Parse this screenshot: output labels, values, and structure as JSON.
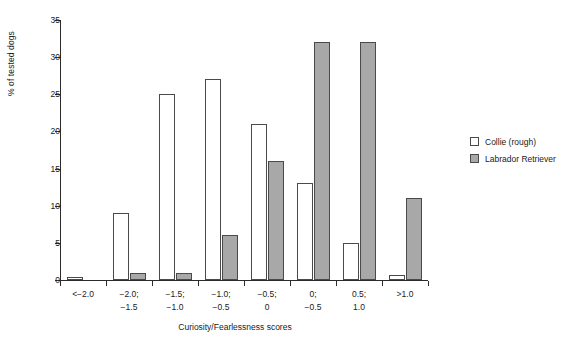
{
  "chart_data": {
    "type": "bar",
    "title": "",
    "xlabel": "Curiosity/Fearlessness scores",
    "ylabel": "% of tested dogs",
    "ylim": [
      0,
      35
    ],
    "yticks": [
      0,
      5,
      10,
      15,
      20,
      25,
      30,
      35
    ],
    "ytick_labels": [
      "0",
      "5",
      "10",
      "15",
      "20",
      "25",
      "30",
      "35"
    ],
    "grid": false,
    "legend_position": "right",
    "categories": [
      "<-2.0",
      "-2.0; -1.5",
      "-1.5; -1.0",
      "-1.0; -0.5",
      "-0.5; 0",
      "0; -0.5",
      "0.5; 1.0",
      ">1.0"
    ],
    "category_lines": [
      [
        "<−2.0",
        ""
      ],
      [
        "−2.0;",
        "−1.5"
      ],
      [
        "−1.5;",
        "−1.0"
      ],
      [
        "−1.0;",
        "−0.5"
      ],
      [
        "−0.5;",
        "0"
      ],
      [
        "0;",
        "−0.5"
      ],
      [
        "0.5;",
        "1.0"
      ],
      [
        ">1.0",
        ""
      ]
    ],
    "series": [
      {
        "name": "Collie (rough)",
        "color": "#ffffff",
        "values": [
          0.4,
          9,
          25,
          27,
          21,
          13,
          5,
          0.7
        ]
      },
      {
        "name": "Labrador Retriever",
        "color": "#a8a8a8",
        "values": [
          0,
          1,
          1,
          6,
          16,
          32,
          32,
          11
        ]
      }
    ]
  },
  "legend": {
    "items": [
      {
        "label": "Collie (rough)",
        "swatch": "collie"
      },
      {
        "label": "Labrador Retriever",
        "swatch": "labrador"
      }
    ]
  },
  "colors": {
    "collie": "#ffffff",
    "labrador": "#a8a8a8",
    "axis": "#2b2b2b",
    "bar_outline": "#4a4a4a",
    "background": "#ffffff"
  }
}
